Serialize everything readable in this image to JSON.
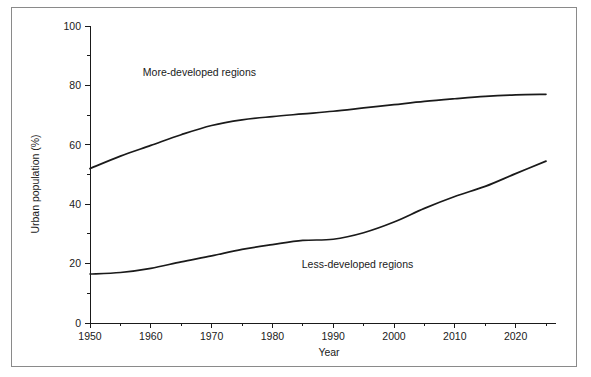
{
  "chart_data": {
    "type": "line",
    "title": "",
    "xlabel": "Year",
    "ylabel": "Urban population (%)",
    "xlim": [
      1950,
      2025
    ],
    "ylim": [
      0,
      100
    ],
    "grid": false,
    "legend_position": "inline-annotation",
    "x_ticks": [
      1950,
      1960,
      1970,
      1980,
      1990,
      2000,
      2010,
      2020
    ],
    "x_tick_labels": [
      "1950",
      "1960",
      "1970",
      "1980",
      "1990",
      "2000",
      "2010",
      "2020"
    ],
    "x_minor_ticks": [
      1955,
      1965,
      1975,
      1985,
      1995,
      2005,
      2015,
      2025
    ],
    "y_ticks": [
      0,
      20,
      40,
      60,
      80,
      100
    ],
    "y_tick_labels": [
      "0",
      "20",
      "40",
      "60",
      "80",
      "100"
    ],
    "y_minor_ticks": [
      10,
      30,
      50,
      70,
      90
    ],
    "x": [
      1950,
      1955,
      1960,
      1965,
      1970,
      1975,
      1980,
      1985,
      1990,
      1995,
      2000,
      2005,
      2010,
      2015,
      2020,
      2025
    ],
    "series": [
      {
        "name": "More-developed regions",
        "label": "More-developed regions",
        "label_x": 1968,
        "label_y": 83,
        "color": "#1a1a1a",
        "values": [
          52.0,
          56.2,
          59.8,
          63.4,
          66.5,
          68.4,
          69.5,
          70.4,
          71.3,
          72.4,
          73.5,
          74.6,
          75.5,
          76.3,
          76.8,
          77.0
        ]
      },
      {
        "name": "Less-developed regions",
        "label": "Less-developed regions",
        "label_x": 1994,
        "label_y": 18.5,
        "color": "#1a1a1a",
        "values": [
          16.5,
          17.0,
          18.4,
          20.6,
          22.6,
          24.8,
          26.4,
          27.8,
          28.2,
          30.4,
          34.0,
          38.6,
          42.6,
          46.0,
          50.3,
          54.5
        ]
      }
    ]
  },
  "axes": {
    "y_label": "Urban population (%)",
    "x_label": "Year"
  }
}
